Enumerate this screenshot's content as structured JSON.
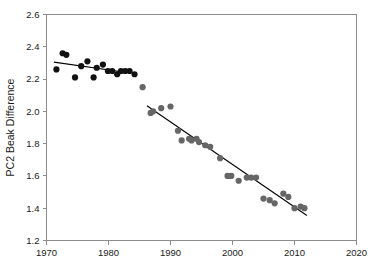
{
  "chart_data": {
    "type": "scatter",
    "title": "",
    "xlabel": "",
    "ylabel": "PC2 Beak Difference",
    "xlim": [
      1970,
      2020
    ],
    "ylim": [
      1.2,
      2.6
    ],
    "xticks": [
      1970,
      1980,
      1990,
      2000,
      2010,
      2020
    ],
    "xtick_labels": [
      "1970",
      "1980",
      "1990",
      "2000",
      "2010",
      "2020"
    ],
    "yticks": [
      1.2,
      1.4,
      1.6,
      1.8,
      2.0,
      2.2,
      2.4,
      2.6
    ],
    "ytick_labels": [
      "1.2",
      "1.4",
      "1.6",
      "1.8",
      "2.0",
      "2.2",
      "2.4",
      "2.6"
    ],
    "grid": false,
    "legend": null,
    "series": [
      {
        "name": "early-period",
        "marker": "filled-circle",
        "color": "#111111",
        "x": [
          1971.6,
          1972.6,
          1973.2,
          1974.6,
          1975.6,
          1976.6,
          1977.6,
          1978.1,
          1979.1,
          1979.9,
          1980.6,
          1981.4,
          1982.0,
          1982.7,
          1983.4,
          1984.2
        ],
        "y": [
          2.26,
          2.36,
          2.35,
          2.21,
          2.28,
          2.31,
          2.21,
          2.27,
          2.29,
          2.25,
          2.25,
          2.23,
          2.25,
          2.25,
          2.25,
          2.23
        ]
      },
      {
        "name": "late-period",
        "marker": "filled-circle",
        "color": "#666666",
        "x": [
          1985.5,
          1986.8,
          1987.2,
          1988.5,
          1990.0,
          1991.2,
          1991.8,
          1993.0,
          1993.4,
          1994.2,
          1994.6,
          1995.6,
          1996.4,
          1998.0,
          1999.2,
          1999.8,
          2001.0,
          2002.3,
          2003.0,
          2003.8,
          2005.0,
          2006.0,
          2006.8,
          2008.2,
          2009.0,
          2010.0,
          2011.0,
          2011.6
        ],
        "y": [
          2.15,
          1.99,
          2.0,
          2.02,
          2.03,
          1.88,
          1.82,
          1.83,
          1.82,
          1.83,
          1.81,
          1.79,
          1.78,
          1.71,
          1.6,
          1.6,
          1.57,
          1.59,
          1.59,
          1.59,
          1.46,
          1.45,
          1.43,
          1.49,
          1.47,
          1.4,
          1.41,
          1.4
        ]
      }
    ],
    "trend_lines": [
      {
        "name": "early-period-trend",
        "x_start": 1971.2,
        "y_start": 2.305,
        "x_end": 1982.1,
        "y_end": 2.245,
        "color": "#000000"
      },
      {
        "name": "late-period-trend",
        "x_start": 1986.2,
        "y_start": 2.035,
        "x_end": 2012.0,
        "y_end": 1.355,
        "color": "#000000"
      }
    ]
  }
}
